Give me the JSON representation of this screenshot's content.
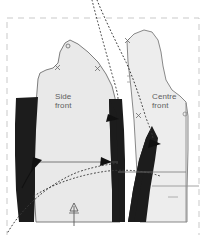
{
  "figure": {
    "type": "sewing-pattern-diagram",
    "background_color": "#ffffff",
    "frame": {
      "name": "cutting-layout-frame",
      "style": "dashed",
      "color": "#c8c8c8",
      "x": 7,
      "y": 18,
      "width": 192,
      "height": 214
    },
    "pieces": [
      {
        "name": "side-front-panel",
        "label": "Side\nfront",
        "label_x": 55,
        "label_y": 92,
        "fill_color": "#e9e9e9",
        "stroke_color": "#6e6e6e"
      },
      {
        "name": "centre-front-panel",
        "label": "Centre\nfront",
        "label_x": 152,
        "label_y": 92,
        "fill_color": "#ededed",
        "stroke_color": "#7a7a7a"
      }
    ],
    "darts": [
      {
        "name": "side-front-left-dart",
        "fill_color": "#1c1c1c",
        "kind": "shaded-dart-wedge"
      },
      {
        "name": "side-front-right-dart",
        "fill_color": "#1c1c1c",
        "kind": "shaded-dart-wedge"
      },
      {
        "name": "centre-front-dart",
        "fill_color": "#1c1c1c",
        "kind": "shaded-dart-wedge"
      }
    ],
    "construction_lines": [
      {
        "name": "upper-dotted-guide-curve-inner",
        "style": "dotted",
        "color": "#3a3a3a"
      },
      {
        "name": "upper-dotted-guide-curve-outer",
        "style": "dotted",
        "color": "#3a3a3a"
      },
      {
        "name": "lower-dotted-guide-curve-a",
        "style": "dotted",
        "color": "#3a3a3a"
      },
      {
        "name": "lower-dotted-guide-curve-b",
        "style": "dotted",
        "color": "#3a3a3a"
      },
      {
        "name": "horizontal-bust-line",
        "style": "solid",
        "color": "#555555"
      },
      {
        "name": "centre-front-vertical-line",
        "style": "solid",
        "color": "#8a8a8a"
      },
      {
        "name": "hem-level-line",
        "style": "solid",
        "color": "#8a8a8a"
      }
    ],
    "markers": [
      {
        "name": "grainline-arrow",
        "x": 74,
        "y": 214,
        "symbol": "up-arrow"
      },
      {
        "name": "notch-shoulder",
        "x": 68,
        "y": 46,
        "symbol": "notch"
      },
      {
        "name": "notch-armhole-left",
        "x": 57,
        "y": 67,
        "symbol": "notch"
      },
      {
        "name": "notch-armhole-right",
        "x": 98,
        "y": 69,
        "symbol": "notch"
      },
      {
        "name": "notch-centre-top",
        "x": 128,
        "y": 40,
        "symbol": "notch"
      },
      {
        "name": "notch-centre-side",
        "x": 139,
        "y": 115,
        "symbol": "notch"
      },
      {
        "name": "notch-centre-front-edge",
        "x": 185,
        "y": 115,
        "symbol": "notch"
      },
      {
        "name": "mark-small-double",
        "x": 128,
        "y": 79,
        "symbol": "tick-pair"
      }
    ],
    "arrows": [
      {
        "name": "dart-close-arrow-left",
        "x": 37,
        "y": 164,
        "direction": "right"
      },
      {
        "name": "dart-close-arrow-centre",
        "x": 106,
        "y": 164,
        "direction": "right"
      },
      {
        "name": "dart-close-arrow-upper-right",
        "x": 113,
        "y": 124,
        "direction": "right"
      },
      {
        "name": "dart-close-arrow-far-right",
        "x": 155,
        "y": 145,
        "direction": "right"
      }
    ]
  }
}
